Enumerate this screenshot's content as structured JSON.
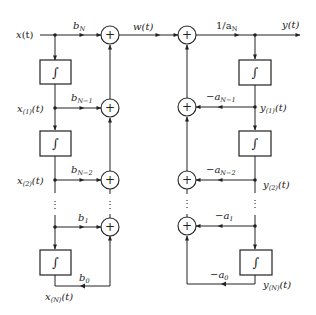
{
  "diagram": {
    "type": "block-diagram",
    "title": "",
    "signals": {
      "input": "x(t)",
      "intermediate": "w(t)",
      "output": "y(t)",
      "left_states": [
        "x(1)(t)",
        "x(2)(t)",
        "x(N)(t)"
      ],
      "right_states": [
        "y(1)(t)",
        "y(2)(t)",
        "y(N)(t)"
      ]
    },
    "labels": {
      "x": "x",
      "t": "(t)",
      "w": "w(t)",
      "y": "y(t)",
      "x1_main": "x",
      "x1_sub": "(1)",
      "x2_main": "x",
      "x2_sub": "(2)",
      "xN_main": "x",
      "xN_sub": "(N)",
      "y1_main": "y",
      "y1_sub": "(1)",
      "y2_main": "y",
      "y2_sub": "(2)",
      "yN_main": "y",
      "yN_sub": "(N)",
      "t_arg": "(t)",
      "plus": "+",
      "integral": "∫",
      "vdots": "⋮"
    },
    "gains": {
      "bN_main": "b",
      "bN_sub": "N",
      "bN1_main": "b",
      "bN1_sub": "N−1",
      "bN2_main": "b",
      "bN2_sub": "N−2",
      "b1_main": "b",
      "b1_sub": "1",
      "b0_main": "b",
      "b0_sub": "0",
      "inv_aN_main": "1/a",
      "inv_aN_sub": "N",
      "aN1_main": "−a",
      "aN1_sub": "N−1",
      "aN2_main": "−a",
      "aN2_sub": "N−2",
      "a1_main": "−a",
      "a1_sub": "1",
      "a0_main": "−a",
      "a0_sub": "0"
    },
    "blocks": {
      "integrators_left": 3,
      "integrators_right": 3,
      "summers_left": 4,
      "summers_right": 4
    }
  }
}
